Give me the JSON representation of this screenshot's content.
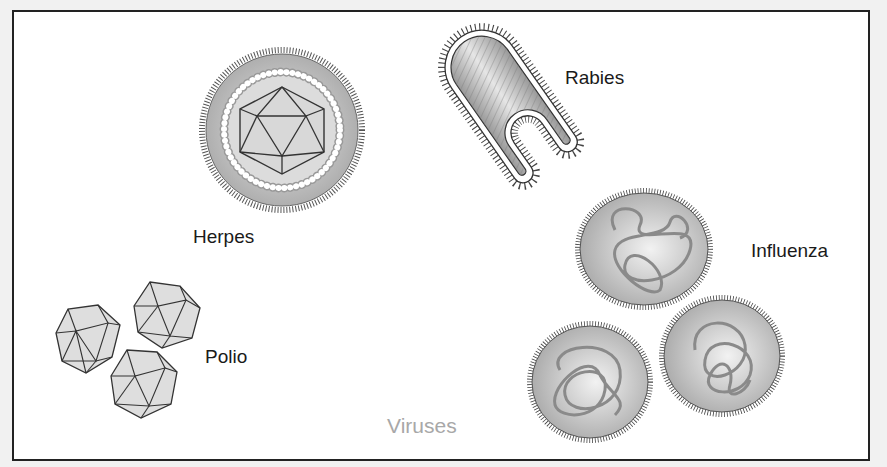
{
  "diagram": {
    "caption": "Viruses",
    "viruses": [
      {
        "name": "Herpes",
        "shape": "enveloped icosahedral capsid"
      },
      {
        "name": "Rabies",
        "shape": "bullet-shaped with spikes"
      },
      {
        "name": "Influenza",
        "shape": "spherical enveloped with RNA coils"
      },
      {
        "name": "Polio",
        "shape": "naked icosahedron"
      }
    ]
  },
  "colors": {
    "frame_border": "#222222",
    "background": "#ffffff",
    "virus_fill": "#bdbdbd",
    "caption": "#a8a8a8"
  }
}
